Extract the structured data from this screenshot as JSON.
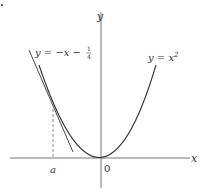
{
  "diagram": {
    "axes": {
      "x_label": "x",
      "y_label": "y",
      "origin_label": "0"
    },
    "curves": [
      {
        "name": "parabola",
        "label_main": "y = x",
        "label_sup": "2"
      },
      {
        "name": "tangent-line",
        "label_main": "y = −x − ",
        "frac_num": "1",
        "frac_den": "4"
      }
    ],
    "markers": {
      "point_label": "a"
    },
    "colors": {
      "stroke": "#333333",
      "axis": "#555555",
      "dashed": "#777777"
    }
  }
}
